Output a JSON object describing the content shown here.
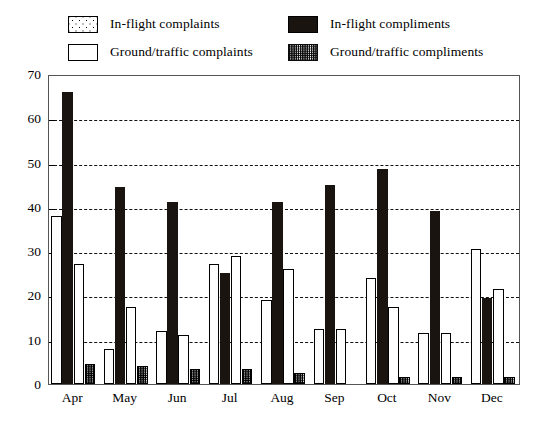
{
  "legend": {
    "items": [
      {
        "label": "In-flight complaints",
        "swatch": "dotted-square-icon"
      },
      {
        "label": "In-flight compliments",
        "swatch": "black-square-icon"
      },
      {
        "label": "Ground/traffic complaints",
        "swatch": "white-square-icon"
      },
      {
        "label": "Ground/traffic compliments",
        "swatch": "hatched-square-icon"
      }
    ]
  },
  "chart_data": {
    "type": "bar",
    "title": "",
    "xlabel": "",
    "ylabel": "",
    "ylim": [
      0,
      70
    ],
    "yticks": [
      0,
      10,
      20,
      30,
      40,
      50,
      60,
      70
    ],
    "grid": true,
    "legend_position": "top",
    "categories": [
      "Apr",
      "May",
      "Jun",
      "Jul",
      "Aug",
      "Sep",
      "Oct",
      "Nov",
      "Dec"
    ],
    "series": [
      {
        "name": "In-flight complaints",
        "color": "#ffffff",
        "pattern": "dotted",
        "values": [
          38,
          8,
          12,
          27,
          19,
          12.5,
          24,
          11.5,
          30.5
        ]
      },
      {
        "name": "In-flight compliments",
        "color": "#1a1410",
        "pattern": "solid",
        "values": [
          66,
          44.5,
          41,
          25,
          41,
          45,
          48.5,
          39,
          19.5
        ]
      },
      {
        "name": "Ground/traffic complaints",
        "color": "#ffffff",
        "pattern": "open",
        "values": [
          27,
          17.5,
          11,
          29,
          26,
          12.5,
          17.5,
          11.5,
          21.5
        ]
      },
      {
        "name": "Ground/traffic compliments",
        "color": "#ffffff",
        "pattern": "hatched",
        "values": [
          4.5,
          4,
          3.5,
          3.5,
          2.5,
          0,
          1.5,
          1.5,
          1.5
        ]
      }
    ]
  },
  "colors": {
    "axis": "#555555",
    "grid": "#111111",
    "black_bar": "#1a1410",
    "background": "#ffffff"
  }
}
